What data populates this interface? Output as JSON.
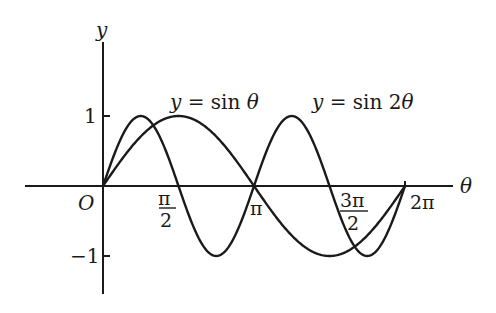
{
  "chart_data": {
    "type": "line",
    "title": "",
    "xlabel": "θ",
    "ylabel": "y",
    "origin_label": "O",
    "xlim": [
      0,
      6.2832
    ],
    "ylim": [
      -1,
      1
    ],
    "grid": false,
    "legend_position": "inline annotations",
    "x_ticks": [
      {
        "value": 1.5708,
        "label": "π/2",
        "num": "π",
        "den": "2"
      },
      {
        "value": 3.1416,
        "label": "π"
      },
      {
        "value": 4.7124,
        "label": "3π/2",
        "num": "3π",
        "den": "2"
      },
      {
        "value": 6.2832,
        "label": "2π"
      }
    ],
    "y_ticks": [
      {
        "value": 1,
        "label": "1"
      },
      {
        "value": -1,
        "label": "−1"
      }
    ],
    "series": [
      {
        "name": "y = sin θ",
        "label_text": "y = sin θ",
        "x": [
          0,
          0.7854,
          1.5708,
          2.3562,
          3.1416,
          3.927,
          4.7124,
          5.4978,
          6.2832
        ],
        "values": [
          0,
          0.707,
          1,
          0.707,
          0,
          -0.707,
          -1,
          -0.707,
          0
        ]
      },
      {
        "name": "y = sin 2θ",
        "label_text": "y = sin 2θ",
        "x": [
          0,
          0.3927,
          0.7854,
          1.1781,
          1.5708,
          1.9635,
          2.3562,
          2.7489,
          3.1416,
          3.5343,
          3.927,
          4.3197,
          4.7124,
          5.1051,
          5.4978,
          5.8905,
          6.2832
        ],
        "values": [
          0,
          0.707,
          1,
          0.707,
          0,
          -0.707,
          -1,
          -0.707,
          0,
          0.707,
          1,
          0.707,
          0,
          -0.707,
          -1,
          -0.707,
          0
        ]
      }
    ],
    "annotations": [
      "y = sin θ",
      "y = sin 2θ"
    ]
  },
  "labels": {
    "y_axis": "y",
    "x_axis": "θ",
    "origin": "O",
    "y_one": "1",
    "y_neg_one": "−1",
    "pi_half_num": "π",
    "pi_half_den": "2",
    "pi": "π",
    "three_pi_half_num": "3π",
    "three_pi_half_den": "2",
    "two_pi": "2π",
    "sin_label_y": "y",
    "sin_label_rest": " = sin ",
    "sin_label_theta": "θ",
    "sin2_label_y": "y",
    "sin2_label_rest": " = sin 2",
    "sin2_label_theta": "θ"
  },
  "colors": {
    "ink": "#1a1a1a",
    "background": "#ffffff"
  }
}
